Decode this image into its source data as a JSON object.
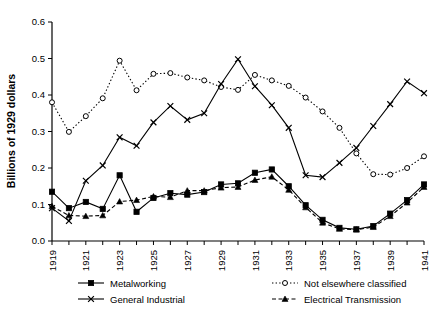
{
  "chart_data": {
    "type": "line",
    "title": "",
    "xlabel": "",
    "ylabel": "Billions of 1929 dollars",
    "xlim": [
      1919,
      1941
    ],
    "ylim": [
      0.0,
      0.6
    ],
    "yticks": [
      "0.0",
      "0.1",
      "0.2",
      "0.3",
      "0.4",
      "0.5",
      "0.6"
    ],
    "ytick_values": [
      0.0,
      0.1,
      0.2,
      0.3,
      0.4,
      0.5,
      0.6
    ],
    "xticks": [
      "1919",
      "1921",
      "1923",
      "1925",
      "1927",
      "1929",
      "1931",
      "1933",
      "1935",
      "1937",
      "1939",
      "1941"
    ],
    "x": [
      1919,
      1920,
      1921,
      1922,
      1923,
      1924,
      1925,
      1926,
      1927,
      1928,
      1929,
      1930,
      1931,
      1932,
      1933,
      1934,
      1935,
      1936,
      1937,
      1938,
      1939,
      1940,
      1941
    ],
    "grid": false,
    "legend_position": "bottom",
    "series": [
      {
        "name": "Metalworking",
        "marker": "filled-square",
        "linestyle": "solid",
        "values": [
          0.135,
          0.09,
          0.107,
          0.088,
          0.18,
          0.08,
          0.118,
          0.131,
          0.127,
          0.134,
          0.155,
          0.158,
          0.158,
          0.187,
          0.196,
          0.196,
          0.173,
          0.143,
          0.11,
          0.078,
          0.05,
          0.035,
          0.033
        ]
      },
      {
        "name": "General Industrial",
        "marker": "cross",
        "linestyle": "solid",
        "values": [
          0.09,
          0.055,
          0.165,
          0.207,
          0.284,
          0.261,
          0.325,
          0.37,
          0.332,
          0.35,
          0.43,
          0.405,
          0.372,
          0.368,
          0.41,
          0.498,
          0.424,
          0.372,
          0.31,
          0.18,
          0.175,
          0.214,
          0.255
        ]
      },
      {
        "name": "Not elsewhere classified",
        "marker": "open-circle",
        "linestyle": "dotted",
        "values": [
          0.38,
          0.299,
          0.342,
          0.391,
          0.494,
          0.413,
          0.458,
          0.46,
          0.448,
          0.44,
          0.422,
          0.414,
          0.455,
          0.44,
          0.425,
          0.393,
          0.355,
          0.31,
          0.24,
          0.183,
          0.182,
          0.2,
          0.232
        ]
      },
      {
        "name": "Electrical Transmission",
        "marker": "filled-triangle",
        "linestyle": "dashed",
        "values": [
          0.095,
          0.07,
          0.068,
          0.07,
          0.108,
          0.112,
          0.122,
          0.12,
          0.138,
          0.138,
          0.146,
          0.148,
          0.15,
          0.167,
          0.176,
          0.195,
          0.18,
          0.16,
          0.13,
          0.09,
          0.06,
          0.042,
          0.037
        ]
      }
    ],
    "series_plot_values": {
      "Metalworking": [
        0.135,
        0.09,
        0.107,
        0.088,
        0.18,
        0.08,
        0.118,
        0.131,
        0.127,
        0.134,
        0.155,
        0.158,
        0.187,
        0.196,
        0.15,
        0.098,
        0.058,
        0.036,
        0.032,
        0.041,
        0.075,
        0.112,
        0.155
      ],
      "General Industrial": [
        0.09,
        0.055,
        0.165,
        0.207,
        0.284,
        0.261,
        0.325,
        0.37,
        0.332,
        0.35,
        0.43,
        0.498,
        0.424,
        0.372,
        0.31,
        0.18,
        0.175,
        0.214,
        0.255,
        0.315,
        0.375,
        0.437,
        0.405
      ],
      "Not elsewhere classified": [
        0.38,
        0.299,
        0.342,
        0.391,
        0.494,
        0.413,
        0.458,
        0.46,
        0.448,
        0.44,
        0.422,
        0.414,
        0.455,
        0.44,
        0.425,
        0.393,
        0.355,
        0.31,
        0.24,
        0.183,
        0.182,
        0.2,
        0.232
      ],
      "Electrical Transmission": [
        0.095,
        0.07,
        0.068,
        0.07,
        0.108,
        0.112,
        0.122,
        0.12,
        0.138,
        0.138,
        0.146,
        0.148,
        0.167,
        0.176,
        0.14,
        0.092,
        0.05,
        0.033,
        0.031,
        0.038,
        0.068,
        0.105,
        0.148
      ]
    }
  },
  "chart": {
    "yaxis_title": "Billions of 1929 dollars",
    "series_values": {
      "Metalworking": [
        0.135,
        0.09,
        0.107,
        0.088,
        0.18,
        0.08,
        0.118,
        0.131,
        0.127,
        0.134,
        0.155,
        0.158,
        0.187,
        0.196,
        0.15,
        0.098,
        0.058,
        0.036,
        0.032,
        0.041,
        0.075,
        0.112,
        0.155
      ],
      "General Industrial": [
        0.09,
        0.055,
        0.165,
        0.207,
        0.284,
        0.261,
        0.325,
        0.37,
        0.332,
        0.35,
        0.43,
        0.498,
        0.424,
        0.372,
        0.31,
        0.18,
        0.175,
        0.214,
        0.255,
        0.315,
        0.375,
        0.437,
        0.405
      ],
      "Not elsewhere classified": [
        0.38,
        0.299,
        0.342,
        0.391,
        0.494,
        0.413,
        0.458,
        0.46,
        0.448,
        0.44,
        0.422,
        0.414,
        0.455,
        0.44,
        0.425,
        0.393,
        0.355,
        0.31,
        0.24,
        0.183,
        0.182,
        0.2,
        0.232
      ],
      "Electrical Transmission": [
        0.095,
        0.07,
        0.068,
        0.07,
        0.108,
        0.112,
        0.122,
        0.12,
        0.138,
        0.138,
        0.146,
        0.148,
        0.167,
        0.176,
        0.14,
        0.092,
        0.05,
        0.033,
        0.031,
        0.038,
        0.068,
        0.105,
        0.148
      ]
    }
  },
  "legend": {
    "entries": [
      {
        "label": "Metalworking",
        "marker": "filled-square",
        "linestyle": "solid"
      },
      {
        "label": "Not elsewhere classified",
        "marker": "open-circle",
        "linestyle": "dotted"
      },
      {
        "label": "General Industrial",
        "marker": "cross",
        "linestyle": "solid"
      },
      {
        "label": "Electrical Transmission",
        "marker": "filled-triangle",
        "linestyle": "dashed"
      }
    ]
  },
  "colors": {
    "ink": "#000000",
    "background": "#ffffff"
  }
}
